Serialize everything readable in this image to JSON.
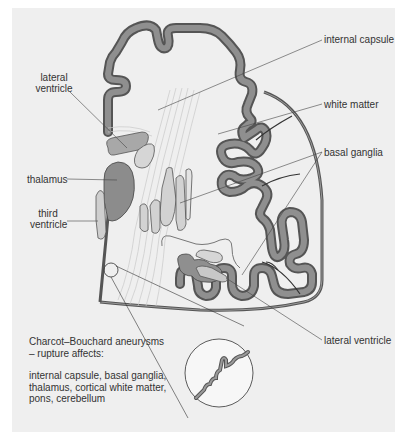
{
  "figure": {
    "background": "#efefef",
    "colors": {
      "cortex_fill": "#8a8a8a",
      "cortex_outline": "#555555",
      "dark_structure": "#9a9a9a",
      "light_structure": "#d0d0d0",
      "leader_line": "#444444"
    }
  },
  "labels": {
    "internal_capsule": "internal capsule",
    "white_matter": "white matter",
    "basal_ganglia": "basal ganglia",
    "lateral_ventricle_top_line1": "lateral",
    "lateral_ventricle_top_line2": "ventricle",
    "thalamus": "thalamus",
    "third_ventricle_line1": "third",
    "third_ventricle_line2": "ventricle",
    "lateral_ventricle_bottom": "lateral ventricle"
  },
  "note": {
    "title_line1": "Charcot–Bouchard aneurysms",
    "title_line2": "– rupture affects:",
    "body_line1": "internal capsule, basal ganglia,",
    "body_line2": "thalamus, cortical white matter,",
    "body_line3": "pons, cerebellum"
  }
}
